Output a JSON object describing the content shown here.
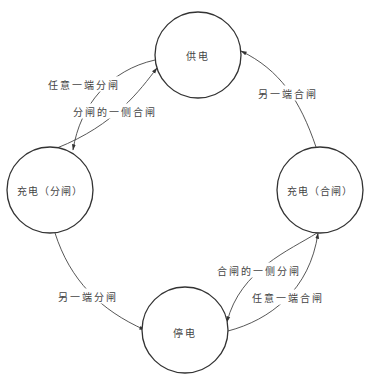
{
  "diagram": {
    "type": "state-diagram",
    "nodes": [
      {
        "id": "supply",
        "label": "供电",
        "cx": 198,
        "cy": 55,
        "r": 43
      },
      {
        "id": "charging_open",
        "label": "充电（分闸）",
        "cx": 50,
        "cy": 190,
        "r": 43
      },
      {
        "id": "charging_closed",
        "label": "充电（合闸）",
        "cx": 320,
        "cy": 190,
        "r": 43
      },
      {
        "id": "outage",
        "label": "停电",
        "cx": 185,
        "cy": 330,
        "r": 43
      }
    ],
    "edges": [
      {
        "id": "e1",
        "from": "supply",
        "to": "charging_open",
        "label": "任意一端分闸"
      },
      {
        "id": "e2",
        "from": "charging_open",
        "to": "supply",
        "label": "分闸的一侧合闸"
      },
      {
        "id": "e3",
        "from": "charging_closed",
        "to": "supply",
        "label": "另一端合闸"
      },
      {
        "id": "e4",
        "from": "charging_open",
        "to": "outage",
        "label": "另一端分闸"
      },
      {
        "id": "e5",
        "from": "charging_closed",
        "to": "outage",
        "label": "合闸的一侧分闸"
      },
      {
        "id": "e6",
        "from": "outage",
        "to": "charging_closed",
        "label": "任意一端合闸"
      }
    ]
  }
}
